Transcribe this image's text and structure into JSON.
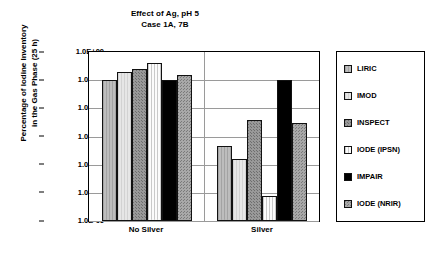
{
  "chart_data": {
    "type": "bar",
    "title": "Effect of Ag, pH 5",
    "subtitle": "Case 1A, 7B",
    "xlabel": "",
    "ylabel": "Percentage of Iodine Inventory\nin the Gas Phase (25 h)",
    "ylabel_line1": "Percentage of Iodine Inventory",
    "ylabel_line2": "in the Gas Phase (25 h)",
    "scale": "log",
    "ylim": [
      1e-06,
      1
    ],
    "grid": true,
    "legend_position": "right",
    "ytick_labels": [
      "1.0E+00",
      "1.0E-01",
      "1.0E-02",
      "1.0E-03",
      "1.0E-04",
      "1.0E-05",
      "1.0E-06"
    ],
    "ytick_values": [
      1,
      0.1,
      0.01,
      0.001,
      0.0001,
      1e-05,
      1e-06
    ],
    "categories": [
      "No Silver",
      "Silver"
    ],
    "series": [
      {
        "name": "LIRIC",
        "fill": "light-gray-vertical-hatch",
        "color": "#b5b5b5",
        "values": [
          0.1,
          0.00045
        ]
      },
      {
        "name": "IMOD",
        "fill": "very-light-gray",
        "color": "#e0e0e0",
        "values": [
          0.2,
          0.00016
        ]
      },
      {
        "name": "INSPECT",
        "fill": "medium-gray-dotted",
        "color": "#8f8f8f",
        "values": [
          0.24,
          0.004
        ]
      },
      {
        "name": "IODE (IPSN)",
        "fill": "white-vertical-lines",
        "color": "#f2f2f2",
        "values": [
          0.4,
          8e-06
        ]
      },
      {
        "name": "IMPAIR",
        "fill": "solid-black",
        "color": "#000000",
        "values": [
          0.1,
          0.1
        ]
      },
      {
        "name": "IODE (NRIR)",
        "fill": "gray-checker",
        "color": "#9e9e9e",
        "values": [
          0.15,
          0.003
        ]
      }
    ]
  },
  "legend": {
    "items": [
      {
        "label": "LIRIC"
      },
      {
        "label": "IMOD"
      },
      {
        "label": "INSPECT"
      },
      {
        "label": "IODE (IPSN)"
      },
      {
        "label": "IMPAIR"
      },
      {
        "label": "IODE (NRIR)"
      }
    ]
  }
}
